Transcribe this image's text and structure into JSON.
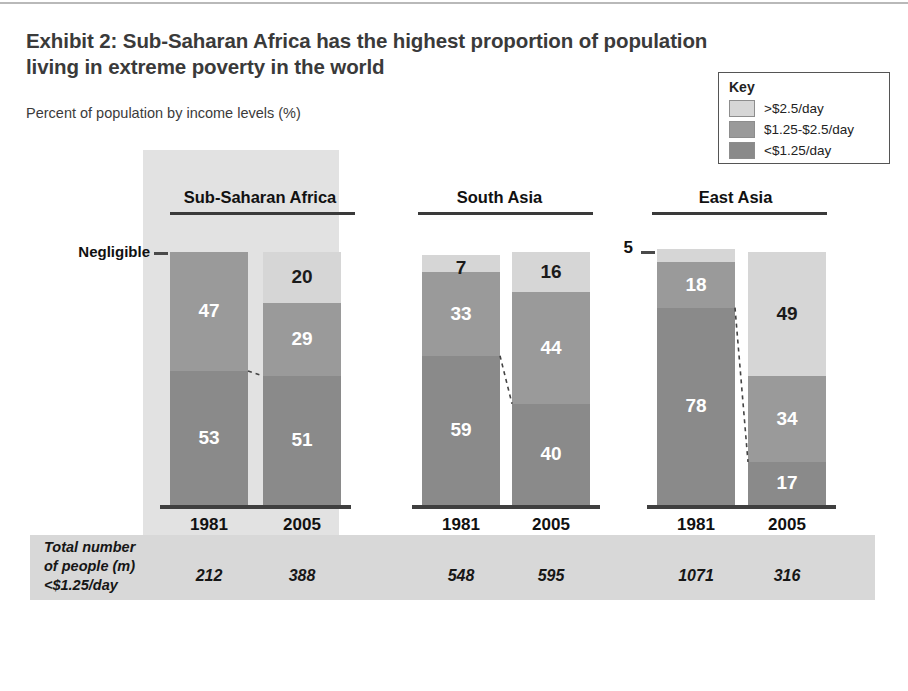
{
  "exhibit": {
    "title": "Exhibit 2: Sub-Saharan Africa has the highest proportion of population living in extreme poverty in the world",
    "subtitle": "Percent of population by income levels (%)",
    "negligible_label": "Negligible",
    "east_asia_top_label": "5"
  },
  "legend": {
    "title": "Key",
    "items": [
      {
        "label": ">$2.5/day",
        "color": "#d6d6d6"
      },
      {
        "label": "$1.25-$2.5/day",
        "color": "#9a9a9a"
      },
      {
        "label": "<$1.25/day",
        "color": "#8a8a8a"
      }
    ]
  },
  "footer": {
    "label_line1": "Total number",
    "label_line2": "of people (m)",
    "label_line3": "<$1.25/day",
    "values": [
      "212",
      "388",
      "548",
      "595",
      "1071",
      "316"
    ]
  },
  "chart_data": {
    "type": "bar",
    "title": "Exhibit 2: Sub-Saharan Africa has the highest proportion of population living in extreme poverty in the world",
    "subtitle": "Percent of population by income levels (%)",
    "ylabel": "Percent of population by income levels (%)",
    "xlabel": "",
    "ylim": [
      0,
      100
    ],
    "grid": false,
    "stacked": true,
    "legend_position": "top-right",
    "legend_entries": [
      ">$2.5/day",
      "$1.25-$2.5/day",
      "<$1.25/day"
    ],
    "series": [
      {
        "name": ">$2.5/day",
        "values": [
          0,
          20,
          7,
          16,
          5,
          49
        ]
      },
      {
        "name": "$1.25-$2.5/day",
        "values": [
          47,
          29,
          33,
          44,
          18,
          34
        ]
      },
      {
        "name": "<$1.25/day",
        "values": [
          53,
          51,
          59,
          40,
          78,
          17
        ]
      }
    ],
    "groups": [
      {
        "name": "Sub-Saharan Africa",
        "highlighted": true,
        "bars": [
          {
            "year": "1981",
            "total_people_m": "212",
            "segments": [
              {
                "label": "Negligible",
                "value": 0,
                "category": ">$2.5/day",
                "display": "",
                "external_label": "Negligible"
              },
              {
                "label": "47",
                "value": 47,
                "category": "$1.25-$2.5/day",
                "display": "47"
              },
              {
                "label": "53",
                "value": 53,
                "category": "<$1.25/day",
                "display": "53"
              }
            ]
          },
          {
            "year": "2005",
            "total_people_m": "388",
            "segments": [
              {
                "label": "20",
                "value": 20,
                "category": ">$2.5/day",
                "display": "20"
              },
              {
                "label": "29",
                "value": 29,
                "category": "$1.25-$2.5/day",
                "display": "29"
              },
              {
                "label": "51",
                "value": 51,
                "category": "<$1.25/day",
                "display": "51"
              }
            ]
          }
        ]
      },
      {
        "name": "South Asia",
        "highlighted": false,
        "bars": [
          {
            "year": "1981",
            "total_people_m": "548",
            "segments": [
              {
                "label": "7",
                "value": 7,
                "category": ">$2.5/day",
                "display": "7"
              },
              {
                "label": "33",
                "value": 33,
                "category": "$1.25-$2.5/day",
                "display": "33"
              },
              {
                "label": "59",
                "value": 59,
                "category": "<$1.25/day",
                "display": "59"
              }
            ]
          },
          {
            "year": "2005",
            "total_people_m": "595",
            "segments": [
              {
                "label": "16",
                "value": 16,
                "category": ">$2.5/day",
                "display": "16"
              },
              {
                "label": "44",
                "value": 44,
                "category": "$1.25-$2.5/day",
                "display": "44"
              },
              {
                "label": "40",
                "value": 40,
                "category": "<$1.25/day",
                "display": "40"
              }
            ]
          }
        ]
      },
      {
        "name": "East Asia",
        "highlighted": false,
        "bars": [
          {
            "year": "1981",
            "total_people_m": "1071",
            "segments": [
              {
                "label": "5",
                "value": 5,
                "category": ">$2.5/day",
                "display": "",
                "external_label": "5"
              },
              {
                "label": "18",
                "value": 18,
                "category": "$1.25-$2.5/day",
                "display": "18"
              },
              {
                "label": "78",
                "value": 78,
                "category": "<$1.25/day",
                "display": "78"
              }
            ]
          },
          {
            "year": "2005",
            "total_people_m": "316",
            "segments": [
              {
                "label": "49",
                "value": 49,
                "category": ">$2.5/day",
                "display": "49"
              },
              {
                "label": "34",
                "value": 34,
                "category": "$1.25-$2.5/day",
                "display": "34"
              },
              {
                "label": "17",
                "value": 17,
                "category": "<$1.25/day",
                "display": "17"
              }
            ]
          }
        ]
      }
    ],
    "footer_row": {
      "label": "Total number of people (m) <$1.25/day",
      "values": [
        "212",
        "388",
        "548",
        "595",
        "1071",
        "316"
      ]
    }
  },
  "colors": {
    "light": "#d6d6d6",
    "medium": "#9a9a9a",
    "dark": "#8a8a8a",
    "panel": "#e2e2e2",
    "band": "#d8d8d8"
  }
}
